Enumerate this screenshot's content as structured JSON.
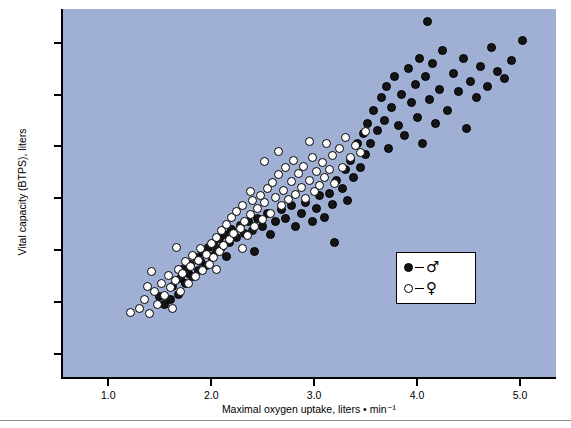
{
  "chart_data": {
    "type": "scatter",
    "title": "",
    "xlabel": "Maximal oxygen uptake, liters • min⁻¹",
    "ylabel": "Vital capacity (BTPS), liters",
    "xlim": [
      0.55,
      5.35
    ],
    "ylim": [
      0.55,
      7.65
    ],
    "xticks": [
      1.0,
      2.0,
      3.0,
      4.0,
      5.0
    ],
    "xticklabels": [
      "1.0",
      "2.0",
      "3.0",
      "4.0",
      "5.0"
    ],
    "yticks": [
      1.0,
      2.0,
      3.0,
      4.0,
      5.0,
      6.0,
      7.0
    ],
    "yticklabels": [
      "1.0",
      "2.0",
      "3.0",
      "4.0",
      "5.0",
      "6.0",
      "7.0"
    ],
    "grid": false,
    "panel_color": "#9fb0d4",
    "legend": {
      "position": "bottom-right",
      "entries": [
        {
          "key": "male",
          "symbol": "♂",
          "marker": "filled-circle",
          "color": "#151515"
        },
        {
          "key": "female",
          "symbol": "♀",
          "marker": "open-circle",
          "color": "#ffffff"
        }
      ]
    },
    "series": [
      {
        "name": "male",
        "marker": "filled-circle",
        "points": [
          [
            1.55,
            1.95
          ],
          [
            1.6,
            2.05
          ],
          [
            1.62,
            2.3
          ],
          [
            1.68,
            2.15
          ],
          [
            1.7,
            2.45
          ],
          [
            1.72,
            2.62
          ],
          [
            1.75,
            2.35
          ],
          [
            1.78,
            2.55
          ],
          [
            1.8,
            2.72
          ],
          [
            1.82,
            2.48
          ],
          [
            1.86,
            2.85
          ],
          [
            1.88,
            2.6
          ],
          [
            1.9,
            2.78
          ],
          [
            1.92,
            2.95
          ],
          [
            1.95,
            2.7
          ],
          [
            1.97,
            3.05
          ],
          [
            2.0,
            2.88
          ],
          [
            2.02,
            3.12
          ],
          [
            2.05,
            2.98
          ],
          [
            2.08,
            3.22
          ],
          [
            2.1,
            3.05
          ],
          [
            2.13,
            3.3
          ],
          [
            2.18,
            3.15
          ],
          [
            2.2,
            3.4
          ],
          [
            2.25,
            3.25
          ],
          [
            2.28,
            3.48
          ],
          [
            2.32,
            3.32
          ],
          [
            2.36,
            3.55
          ],
          [
            2.4,
            3.38
          ],
          [
            2.45,
            3.6
          ],
          [
            2.5,
            3.45
          ],
          [
            2.55,
            3.7
          ],
          [
            2.58,
            3.3
          ],
          [
            2.62,
            3.55
          ],
          [
            2.68,
            3.78
          ],
          [
            2.72,
            3.6
          ],
          [
            2.78,
            3.85
          ],
          [
            2.82,
            3.45
          ],
          [
            2.88,
            3.7
          ],
          [
            2.92,
            3.92
          ],
          [
            2.98,
            3.55
          ],
          [
            3.02,
            3.8
          ],
          [
            3.05,
            4.05
          ],
          [
            3.1,
            3.62
          ],
          [
            3.15,
            4.1
          ],
          [
            3.18,
            3.88
          ],
          [
            3.22,
            4.35
          ],
          [
            3.28,
            4.18
          ],
          [
            3.3,
            4.55
          ],
          [
            3.32,
            3.95
          ],
          [
            3.35,
            4.72
          ],
          [
            3.38,
            4.4
          ],
          [
            3.42,
            5.05
          ],
          [
            3.45,
            4.6
          ],
          [
            3.48,
            5.25
          ],
          [
            3.5,
            4.85
          ],
          [
            3.52,
            5.45
          ],
          [
            3.55,
            5.05
          ],
          [
            3.58,
            5.7
          ],
          [
            3.62,
            5.3
          ],
          [
            3.65,
            5.95
          ],
          [
            3.68,
            5.5
          ],
          [
            3.7,
            6.15
          ],
          [
            3.72,
            4.95
          ],
          [
            3.75,
            5.75
          ],
          [
            3.78,
            6.35
          ],
          [
            3.82,
            5.4
          ],
          [
            3.85,
            6.0
          ],
          [
            3.88,
            5.2
          ],
          [
            3.92,
            6.5
          ],
          [
            3.95,
            5.85
          ],
          [
            3.98,
            6.2
          ],
          [
            4.0,
            5.55
          ],
          [
            4.02,
            6.7
          ],
          [
            4.05,
            5.05
          ],
          [
            4.08,
            6.35
          ],
          [
            4.1,
            7.4
          ],
          [
            4.12,
            5.9
          ],
          [
            4.15,
            6.6
          ],
          [
            4.18,
            5.45
          ],
          [
            4.22,
            6.1
          ],
          [
            4.25,
            6.85
          ],
          [
            4.3,
            5.7
          ],
          [
            4.35,
            6.4
          ],
          [
            4.4,
            6.05
          ],
          [
            4.45,
            6.7
          ],
          [
            4.48,
            5.35
          ],
          [
            4.52,
            6.25
          ],
          [
            4.58,
            5.95
          ],
          [
            4.62,
            6.55
          ],
          [
            4.68,
            6.15
          ],
          [
            4.72,
            6.9
          ],
          [
            4.78,
            6.45
          ],
          [
            4.85,
            6.3
          ],
          [
            4.92,
            6.65
          ],
          [
            5.02,
            7.05
          ],
          [
            3.2,
            3.15
          ],
          [
            2.42,
            2.98
          ],
          [
            1.5,
            2.1
          ],
          [
            2.15,
            2.88
          ]
        ]
      },
      {
        "name": "female",
        "marker": "open-circle",
        "points": [
          [
            1.22,
            1.8
          ],
          [
            1.3,
            1.88
          ],
          [
            1.35,
            2.05
          ],
          [
            1.4,
            1.78
          ],
          [
            1.45,
            2.2
          ],
          [
            1.48,
            1.95
          ],
          [
            1.52,
            2.35
          ],
          [
            1.55,
            2.12
          ],
          [
            1.58,
            2.5
          ],
          [
            1.6,
            2.28
          ],
          [
            1.62,
            1.88
          ],
          [
            1.65,
            2.42
          ],
          [
            1.68,
            2.62
          ],
          [
            1.7,
            2.2
          ],
          [
            1.72,
            2.55
          ],
          [
            1.75,
            2.78
          ],
          [
            1.78,
            2.35
          ],
          [
            1.8,
            2.68
          ],
          [
            1.82,
            2.9
          ],
          [
            1.85,
            2.48
          ],
          [
            1.88,
            2.8
          ],
          [
            1.9,
            3.02
          ],
          [
            1.92,
            2.6
          ],
          [
            1.95,
            2.92
          ],
          [
            1.98,
            2.72
          ],
          [
            2.0,
            3.12
          ],
          [
            2.02,
            2.85
          ],
          [
            2.05,
            3.25
          ],
          [
            2.08,
            2.98
          ],
          [
            2.1,
            3.38
          ],
          [
            2.12,
            3.08
          ],
          [
            2.15,
            3.5
          ],
          [
            2.18,
            3.2
          ],
          [
            2.2,
            3.62
          ],
          [
            2.22,
            3.32
          ],
          [
            2.25,
            3.75
          ],
          [
            2.28,
            3.42
          ],
          [
            2.3,
            3.85
          ],
          [
            2.32,
            3.55
          ],
          [
            2.35,
            3.28
          ],
          [
            2.38,
            3.68
          ],
          [
            2.4,
            3.95
          ],
          [
            2.42,
            3.45
          ],
          [
            2.45,
            3.8
          ],
          [
            2.48,
            4.05
          ],
          [
            2.5,
            3.58
          ],
          [
            2.52,
            3.92
          ],
          [
            2.55,
            4.18
          ],
          [
            2.58,
            3.7
          ],
          [
            2.6,
            4.3
          ],
          [
            2.62,
            4.02
          ],
          [
            2.65,
            4.45
          ],
          [
            2.68,
            3.85
          ],
          [
            2.7,
            4.15
          ],
          [
            2.72,
            4.6
          ],
          [
            2.75,
            3.98
          ],
          [
            2.78,
            4.32
          ],
          [
            2.8,
            4.72
          ],
          [
            2.82,
            4.08
          ],
          [
            2.85,
            4.48
          ],
          [
            2.88,
            4.2
          ],
          [
            2.9,
            4.62
          ],
          [
            2.92,
            4.0
          ],
          [
            2.95,
            4.35
          ],
          [
            2.98,
            4.78
          ],
          [
            3.0,
            4.12
          ],
          [
            3.02,
            4.52
          ],
          [
            3.05,
            4.25
          ],
          [
            3.08,
            4.68
          ],
          [
            3.1,
            4.4
          ],
          [
            3.12,
            5.05
          ],
          [
            3.15,
            4.55
          ],
          [
            3.18,
            4.82
          ],
          [
            3.2,
            4.28
          ],
          [
            3.25,
            4.95
          ],
          [
            3.28,
            4.6
          ],
          [
            3.3,
            5.18
          ],
          [
            3.35,
            4.78
          ],
          [
            3.4,
            5.02
          ],
          [
            3.45,
            4.88
          ],
          [
            3.5,
            5.28
          ],
          [
            2.65,
            4.9
          ],
          [
            2.52,
            4.7
          ],
          [
            2.38,
            4.12
          ],
          [
            2.05,
            2.62
          ],
          [
            1.42,
            2.58
          ],
          [
            1.38,
            2.3
          ],
          [
            1.66,
            3.05
          ],
          [
            2.3,
            3.02
          ],
          [
            2.95,
            5.1
          ]
        ]
      }
    ]
  },
  "figure": {
    "panel_background": "#9fb0d4",
    "axis_color": "#000000",
    "bottom_rule_color": "#8b8b8b"
  }
}
